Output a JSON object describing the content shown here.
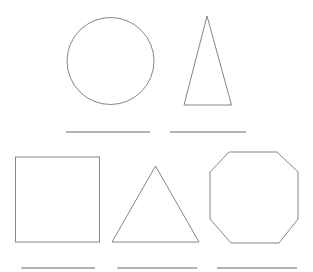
{
  "canvas": {
    "width": 313,
    "height": 272,
    "background_color": "#ffffff"
  },
  "style": {
    "shape_stroke_color": "#858585",
    "answer_line_color": "#9b9b9b",
    "shape_stroke_width": 1,
    "answer_line_width": 1.3,
    "fill": "none"
  },
  "shapes": [
    {
      "name": "circle-shape",
      "type": "circle",
      "cx": 110.5,
      "cy": 61,
      "r": 43.5
    },
    {
      "name": "tall-triangle-shape",
      "type": "polygon",
      "points": "207,16 231.5,105 184,105"
    },
    {
      "name": "square-shape",
      "type": "rect",
      "x": 15.5,
      "y": 157,
      "width": 84,
      "height": 85
    },
    {
      "name": "triangle-shape",
      "type": "polygon",
      "points": "155.5,166 199,242 112,242"
    },
    {
      "name": "octagon-shape",
      "type": "polygon",
      "points": "229,152 277,152 298,172 298,219 279,243 231,243 210,219 210,172"
    }
  ],
  "answer_lines": [
    {
      "name": "answer-line-under-circle",
      "x1": 66,
      "y1": 132,
      "x2": 150,
      "y2": 132
    },
    {
      "name": "answer-line-under-tall-triangle",
      "x1": 170,
      "y1": 132,
      "x2": 246,
      "y2": 132
    },
    {
      "name": "answer-line-under-square",
      "x1": 21,
      "y1": 268,
      "x2": 95,
      "y2": 268
    },
    {
      "name": "answer-line-under-triangle",
      "x1": 117,
      "y1": 268,
      "x2": 197,
      "y2": 268
    },
    {
      "name": "answer-line-under-octagon",
      "x1": 217,
      "y1": 268,
      "x2": 297,
      "y2": 268
    }
  ]
}
